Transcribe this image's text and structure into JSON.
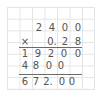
{
  "problem": {
    "multiplicand": [
      "2",
      "4",
      "0",
      "0"
    ],
    "operator": "×",
    "multiplier": [
      "0.",
      "2",
      "8"
    ],
    "partial_products": [
      [
        "1",
        "9",
        "2",
        "0",
        "0"
      ],
      [
        "4",
        "8",
        "0",
        "0"
      ]
    ],
    "result": [
      "6",
      "7",
      "2.",
      "0",
      "0"
    ]
  },
  "colors": {
    "digits": "#555555",
    "grid": "#e4e4e4",
    "rule": "#6a6a6a"
  }
}
